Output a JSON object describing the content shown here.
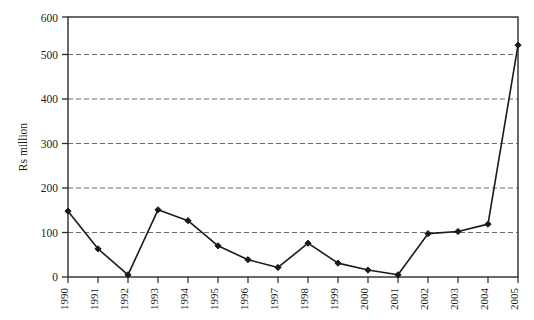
{
  "chart_data": {
    "type": "line",
    "title": "",
    "subtitle": "",
    "xlabel": "",
    "ylabel": "Rs million",
    "categories": [
      "1990",
      "1991",
      "1992",
      "1993",
      "1994",
      "1995",
      "1996",
      "1997",
      "1998",
      "1999",
      "2000",
      "2001",
      "2002",
      "2003",
      "2004",
      "2005"
    ],
    "values": [
      152,
      65,
      5,
      155,
      130,
      72,
      40,
      22,
      78,
      32,
      16,
      5,
      100,
      105,
      122,
      535
    ],
    "series": [
      {
        "name": "Rs million",
        "values": [
          152,
          65,
          5,
          155,
          130,
          72,
          40,
          22,
          78,
          32,
          16,
          5,
          100,
          105,
          122,
          535
        ]
      }
    ],
    "ylim": [
      0,
      600
    ],
    "yticks": [
      0,
      100,
      200,
      300,
      400,
      500,
      600
    ],
    "ytick_labels": [
      "0",
      "100",
      "200",
      "300",
      "400",
      "500",
      "600"
    ],
    "grid": "horizontal-dashed",
    "legend": "none",
    "marker": "filled-diamond",
    "line_color": "#1a1a1a",
    "marker_color": "#1a1a1a",
    "grid_color": "#7a7a7a",
    "axis_color": "#2b2b2b",
    "background_color": "#ffffff"
  },
  "axes": {
    "y_title": "Rs million",
    "y_tick_0": "0",
    "y_tick_1": "100",
    "y_tick_2": "200",
    "y_tick_3": "300",
    "y_tick_4": "400",
    "y_tick_5": "500",
    "y_tick_6": "600",
    "x_tick_0": "1990",
    "x_tick_1": "1991",
    "x_tick_2": "1992",
    "x_tick_3": "1993",
    "x_tick_4": "1994",
    "x_tick_5": "1995",
    "x_tick_6": "1996",
    "x_tick_7": "1997",
    "x_tick_8": "1998",
    "x_tick_9": "1999",
    "x_tick_10": "2000",
    "x_tick_11": "2001",
    "x_tick_12": "2002",
    "x_tick_13": "2003",
    "x_tick_14": "2004",
    "x_tick_15": "2005"
  }
}
